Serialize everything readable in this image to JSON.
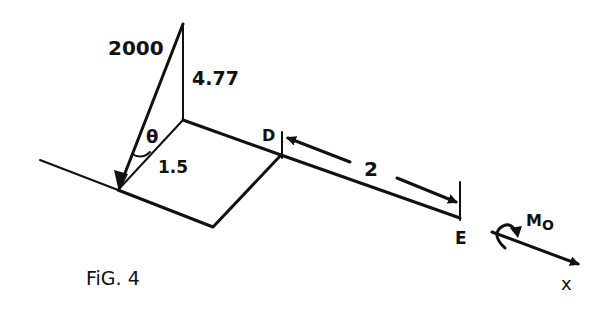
{
  "figure": {
    "caption": "FiG. 4",
    "labels": {
      "force": "2000",
      "height": "4.77",
      "angle": "θ",
      "arm": "1.5",
      "point_d": "D",
      "point_e": "E",
      "span": "2",
      "moment": "M",
      "moment_sub": "O",
      "axis": "x"
    }
  }
}
